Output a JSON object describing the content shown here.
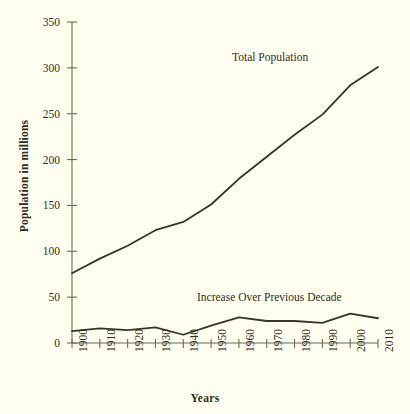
{
  "chart_data": {
    "type": "line",
    "title": "",
    "xlabel": "Years",
    "ylabel": "Population in millions",
    "x": [
      1900,
      1910,
      1920,
      1930,
      1940,
      1950,
      1960,
      1970,
      1980,
      1990,
      2000,
      2010
    ],
    "xlim": [
      1900,
      2010
    ],
    "ylim": [
      0,
      350
    ],
    "yticks": [
      0,
      50,
      100,
      150,
      200,
      250,
      300,
      350
    ],
    "xticks": [
      "1900",
      "1910",
      "1920",
      "1930",
      "1940",
      "1950",
      "1960",
      "1970",
      "1980",
      "1990",
      "2000",
      "2010"
    ],
    "grid": false,
    "legend_position": "inline-annotation",
    "series": [
      {
        "name": "Total Population",
        "values": [
          76,
          92,
          106,
          123,
          132,
          151,
          179,
          203,
          227,
          249,
          281,
          301
        ],
        "color": "#35352a",
        "annotation": "Total Population"
      },
      {
        "name": "Increase Over Previous Decade",
        "values": [
          13,
          16,
          14,
          17,
          9,
          19,
          28,
          24,
          24,
          22,
          32,
          27
        ],
        "color": "#35352a",
        "annotation": "Increase Over Previous Decade"
      }
    ],
    "annotations": [
      {
        "text": "Total Population",
        "x": 1983,
        "y": 312
      },
      {
        "text": "Increase Over Previous Decade",
        "x": 1938,
        "y": 56
      }
    ],
    "colors": {
      "background": "#fffff0",
      "axis": "#6b6b52",
      "line": "#35352a",
      "text": "#2e2e20"
    }
  }
}
